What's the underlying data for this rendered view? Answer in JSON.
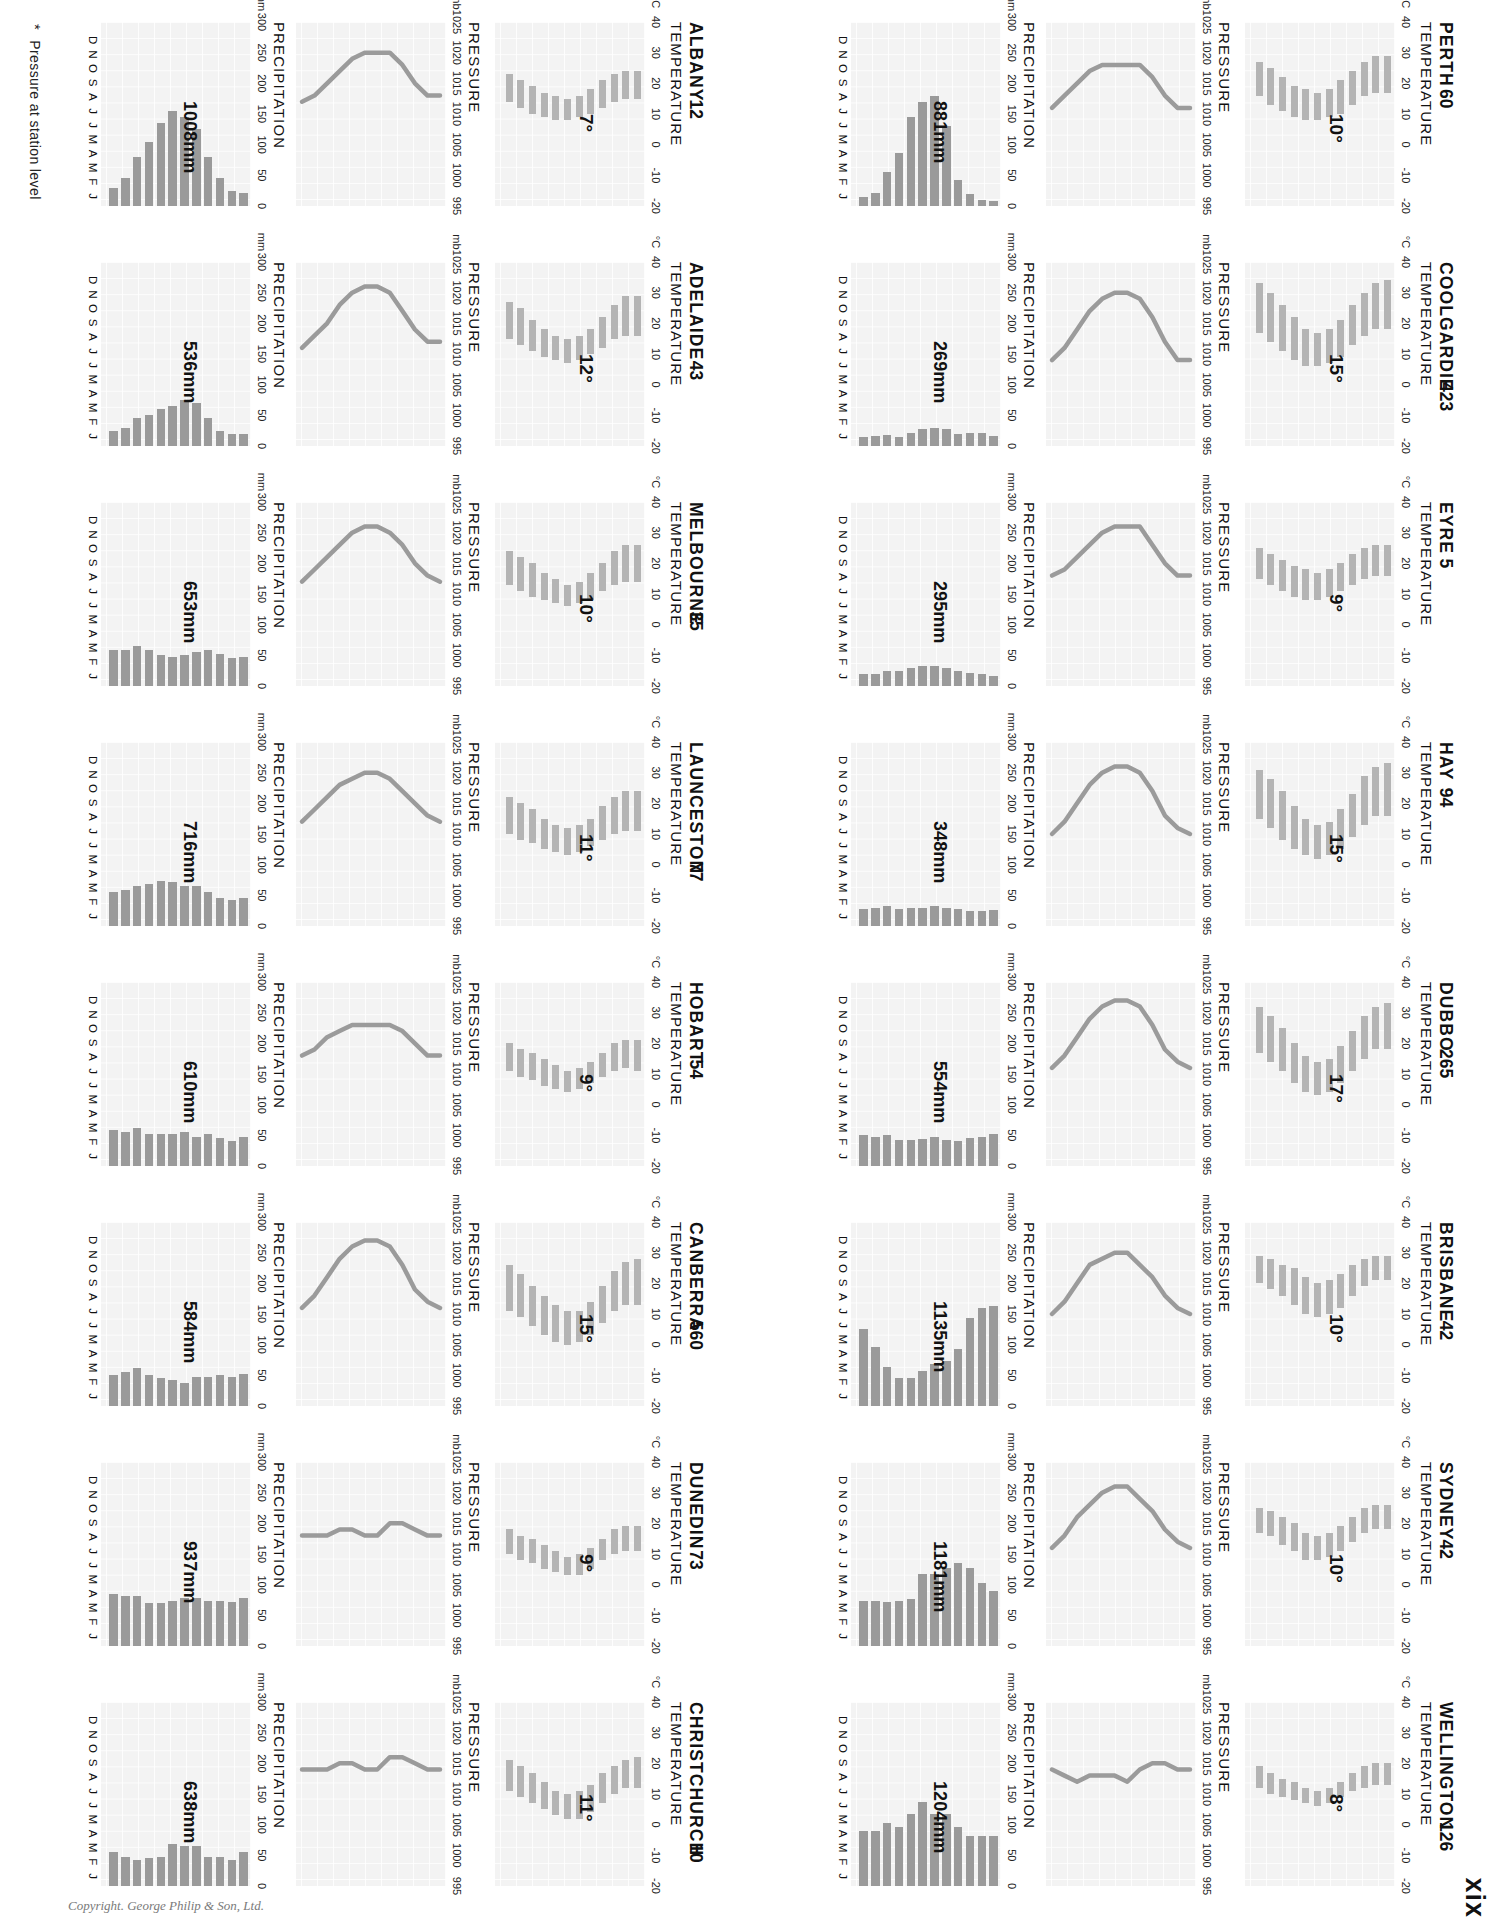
{
  "page": {
    "number": "xix",
    "copyright": "Copyright. George Philip & Son, Ltd.",
    "footnote": "Pressure at station level",
    "footnote_marker": "*"
  },
  "labels": {
    "temperature": "TEMPERATURE",
    "pressure": "PRESSURE",
    "precipitation": "PRECIPITATION",
    "temp_unit": "°C",
    "pressure_unit": "mb",
    "precip_unit": "mm"
  },
  "axes": {
    "temp_ticks": [
      "40",
      "30",
      "20",
      "10",
      "0",
      "-10",
      "-20"
    ],
    "temp_values": [
      40,
      30,
      20,
      10,
      0,
      -10,
      -20
    ],
    "pressure_ticks": [
      "1025",
      "1020",
      "1015",
      "1010",
      "1005",
      "1000",
      "995"
    ],
    "pressure_values": [
      1025,
      1020,
      1015,
      1010,
      1005,
      1000,
      995
    ],
    "precip_ticks": [
      "300",
      "250",
      "200",
      "150",
      "100",
      "50",
      "0"
    ],
    "precip_values": [
      300,
      250,
      200,
      150,
      100,
      50,
      0
    ],
    "months": [
      "J",
      "F",
      "M",
      "A",
      "M",
      "J",
      "J",
      "A",
      "S",
      "O",
      "N",
      "D"
    ]
  },
  "chart_data": {
    "type": "bar",
    "xlabel": "Month",
    "ylabels": [
      "Temperature °C",
      "Pressure mb",
      "Precipitation mm"
    ],
    "ylim_temp": [
      -20,
      40
    ],
    "ylim_pressure": [
      995,
      1025
    ],
    "ylim_precip": [
      0,
      300
    ],
    "grid": true,
    "legend": "none",
    "stations": [
      {
        "name": "PERTH",
        "altitude": "60",
        "temp_annotation": "10°",
        "precip_annotation": "881mm",
        "temp_min": [
          17,
          17,
          16,
          13,
          10,
          9,
          8,
          8,
          9,
          11,
          13,
          16
        ],
        "temp_max": [
          29,
          29,
          27,
          24,
          21,
          18,
          17,
          18,
          19,
          22,
          25,
          27
        ],
        "pressure": [
          1011,
          1011,
          1013,
          1016,
          1018,
          1018,
          1018,
          1018,
          1017,
          1015,
          1013,
          1011
        ],
        "precip": [
          8,
          10,
          20,
          43,
          130,
          180,
          170,
          145,
          86,
          56,
          21,
          14
        ]
      },
      {
        "name": "COOLGARDIE",
        "altitude": "423",
        "temp_annotation": "15°",
        "precip_annotation": "269mm",
        "temp_min": [
          18,
          18,
          16,
          13,
          9,
          7,
          6,
          6,
          8,
          11,
          14,
          17
        ],
        "temp_max": [
          34,
          33,
          30,
          26,
          21,
          18,
          17,
          18,
          22,
          26,
          30,
          33
        ],
        "pressure": [
          1009,
          1009,
          1012,
          1016,
          1019,
          1020,
          1020,
          1019,
          1017,
          1014,
          1011,
          1009
        ],
        "precip": [
          16,
          22,
          22,
          20,
          28,
          30,
          27,
          22,
          14,
          18,
          17,
          15
        ]
      },
      {
        "name": "EYRE",
        "altitude": "5",
        "temp_annotation": "9°",
        "precip_annotation": "295mm",
        "temp_min": [
          16,
          16,
          15,
          13,
          11,
          9,
          8,
          8,
          9,
          11,
          13,
          15
        ],
        "temp_max": [
          26,
          26,
          25,
          23,
          20,
          18,
          17,
          18,
          19,
          21,
          23,
          25
        ],
        "pressure": [
          1013,
          1013,
          1015,
          1018,
          1021,
          1021,
          1021,
          1020,
          1018,
          1016,
          1014,
          1013
        ],
        "precip": [
          16,
          20,
          22,
          25,
          30,
          33,
          32,
          30,
          24,
          24,
          20,
          19
        ]
      },
      {
        "name": "HAY",
        "altitude": "94",
        "temp_annotation": "15°",
        "precip_annotation": "348mm",
        "temp_min": [
          16,
          16,
          13,
          9,
          5,
          3,
          2,
          3,
          5,
          8,
          12,
          15
        ],
        "temp_max": [
          33,
          32,
          29,
          23,
          18,
          14,
          13,
          15,
          19,
          24,
          28,
          31
        ],
        "pressure": [
          1010,
          1011,
          1013,
          1017,
          1020,
          1021,
          1021,
          1020,
          1018,
          1015,
          1012,
          1010
        ],
        "precip": [
          26,
          25,
          25,
          27,
          30,
          32,
          30,
          30,
          28,
          33,
          30,
          28
        ]
      },
      {
        "name": "DUBBO",
        "altitude": "265",
        "temp_annotation": "17°",
        "precip_annotation": "554mm",
        "temp_min": [
          18,
          18,
          15,
          11,
          7,
          4,
          3,
          4,
          7,
          11,
          14,
          17
        ],
        "temp_max": [
          33,
          32,
          29,
          24,
          19,
          15,
          14,
          16,
          20,
          25,
          29,
          32
        ],
        "pressure": [
          1011,
          1012,
          1014,
          1018,
          1021,
          1022,
          1022,
          1021,
          1019,
          1016,
          1013,
          1011
        ],
        "precip": [
          52,
          48,
          45,
          40,
          42,
          48,
          44,
          42,
          42,
          50,
          48,
          50
        ]
      },
      {
        "name": "BRISBANE",
        "altitude": "42",
        "temp_annotation": "10°",
        "precip_annotation": "1135mm",
        "temp_min": [
          21,
          21,
          19,
          16,
          12,
          10,
          9,
          10,
          13,
          16,
          18,
          20
        ],
        "temp_max": [
          29,
          29,
          28,
          26,
          23,
          21,
          20,
          22,
          25,
          26,
          28,
          29
        ],
        "pressure": [
          1010,
          1011,
          1013,
          1016,
          1018,
          1020,
          1020,
          1019,
          1018,
          1015,
          1012,
          1010
        ],
        "precip": [
          163,
          160,
          143,
          93,
          73,
          68,
          57,
          46,
          46,
          64,
          97,
          125
        ]
      },
      {
        "name": "SYDNEY",
        "altitude": "42",
        "temp_annotation": "10°",
        "precip_annotation": "1181mm",
        "temp_min": [
          18,
          18,
          17,
          14,
          11,
          9,
          8,
          8,
          11,
          13,
          16,
          17
        ],
        "temp_max": [
          26,
          26,
          25,
          22,
          19,
          17,
          16,
          17,
          20,
          22,
          24,
          25
        ],
        "pressure": [
          1011,
          1012,
          1014,
          1017,
          1019,
          1021,
          1021,
          1020,
          1018,
          1016,
          1013,
          1011
        ],
        "precip": [
          89,
          102,
          127,
          135,
          127,
          117,
          117,
          76,
          74,
          71,
          74,
          74
        ]
      },
      {
        "name": "WELLINGTON",
        "altitude": "126",
        "temp_annotation": "8°",
        "precip_annotation": "1204mm",
        "temp_min": [
          13,
          13,
          12,
          11,
          9,
          7,
          6,
          7,
          8,
          9,
          10,
          12
        ],
        "temp_max": [
          20,
          20,
          19,
          17,
          14,
          12,
          11,
          12,
          14,
          15,
          17,
          19
        ],
        "pressure": [
          1014,
          1014,
          1015,
          1015,
          1014,
          1012,
          1013,
          1013,
          1013,
          1012,
          1013,
          1014
        ],
        "precip": [
          81,
          81,
          81,
          97,
          117,
          117,
          137,
          117,
          97,
          102,
          89,
          89
        ]
      },
      {
        "name": "ALBANY",
        "altitude": "12",
        "temp_annotation": "7°",
        "precip_annotation": "1008mm",
        "temp_min": [
          15,
          15,
          14,
          12,
          10,
          9,
          8,
          8,
          9,
          10,
          12,
          14
        ],
        "temp_max": [
          24,
          24,
          23,
          21,
          18,
          16,
          15,
          16,
          17,
          19,
          21,
          23
        ],
        "pressure": [
          1013,
          1013,
          1015,
          1018,
          1020,
          1020,
          1020,
          1019,
          1017,
          1015,
          1013,
          1012
        ],
        "precip": [
          22,
          25,
          45,
          80,
          125,
          145,
          155,
          135,
          105,
          80,
          45,
          30
        ]
      },
      {
        "name": "ADELAIDE",
        "altitude": "43",
        "temp_annotation": "12°",
        "precip_annotation": "536mm",
        "temp_min": [
          16,
          16,
          15,
          12,
          10,
          8,
          7,
          8,
          9,
          11,
          13,
          15
        ],
        "temp_max": [
          29,
          29,
          26,
          22,
          18,
          16,
          15,
          16,
          18,
          21,
          25,
          27
        ],
        "pressure": [
          1012,
          1012,
          1014,
          1017,
          1020,
          1021,
          1021,
          1020,
          1018,
          1015,
          1013,
          1011
        ],
        "precip": [
          20,
          20,
          25,
          45,
          70,
          75,
          65,
          60,
          50,
          45,
          30,
          25
        ]
      },
      {
        "name": "MELBOURNE",
        "altitude": "35",
        "temp_annotation": "10°",
        "precip_annotation": "653mm",
        "temp_min": [
          14,
          14,
          13,
          11,
          8,
          7,
          6,
          7,
          8,
          9,
          11,
          13
        ],
        "temp_max": [
          26,
          26,
          24,
          20,
          17,
          14,
          13,
          15,
          17,
          20,
          22,
          24
        ],
        "pressure": [
          1012,
          1013,
          1015,
          1018,
          1020,
          1021,
          1021,
          1020,
          1018,
          1016,
          1014,
          1012
        ],
        "precip": [
          48,
          46,
          53,
          58,
          56,
          50,
          48,
          50,
          58,
          66,
          58,
          58
        ]
      },
      {
        "name": "LAUNCESTON",
        "altitude": "77",
        "temp_annotation": "11°",
        "precip_annotation": "716mm",
        "temp_min": [
          11,
          11,
          10,
          8,
          6,
          4,
          3,
          4,
          5,
          7,
          8,
          10
        ],
        "temp_max": [
          24,
          24,
          22,
          19,
          15,
          13,
          12,
          13,
          15,
          18,
          20,
          22
        ],
        "pressure": [
          1012,
          1013,
          1015,
          1017,
          1019,
          1020,
          1020,
          1019,
          1018,
          1016,
          1014,
          1012
        ],
        "precip": [
          46,
          42,
          46,
          56,
          66,
          66,
          72,
          74,
          68,
          66,
          58,
          56
        ]
      },
      {
        "name": "HOBART",
        "altitude": "54",
        "temp_annotation": "9°",
        "precip_annotation": "610mm",
        "temp_min": [
          11,
          12,
          11,
          9,
          7,
          5,
          4,
          5,
          6,
          8,
          9,
          11
        ],
        "temp_max": [
          21,
          21,
          20,
          17,
          14,
          12,
          11,
          13,
          15,
          17,
          18,
          20
        ],
        "pressure": [
          1013,
          1013,
          1015,
          1017,
          1018,
          1018,
          1018,
          1018,
          1017,
          1016,
          1014,
          1013
        ],
        "precip": [
          48,
          40,
          46,
          52,
          48,
          56,
          53,
          53,
          53,
          62,
          56,
          58
        ]
      },
      {
        "name": "CANBERRA",
        "altitude": "560",
        "temp_annotation": "15°",
        "precip_annotation": "584mm",
        "temp_min": [
          13,
          13,
          11,
          7,
          3,
          1,
          0,
          1,
          3,
          6,
          9,
          11
        ],
        "temp_max": [
          28,
          27,
          24,
          19,
          14,
          11,
          11,
          13,
          16,
          19,
          23,
          26
        ],
        "pressure": [
          1011,
          1012,
          1014,
          1018,
          1021,
          1022,
          1022,
          1021,
          1019,
          1016,
          1013,
          1011
        ],
        "precip": [
          52,
          48,
          50,
          48,
          48,
          38,
          42,
          46,
          50,
          62,
          56,
          50
        ]
      },
      {
        "name": "DUNEDIN",
        "altitude": "73",
        "temp_annotation": "9°",
        "precip_annotation": "937mm",
        "temp_min": [
          11,
          11,
          10,
          8,
          5,
          3,
          3,
          4,
          5,
          7,
          8,
          10
        ],
        "temp_max": [
          19,
          19,
          18,
          15,
          12,
          10,
          9,
          11,
          13,
          15,
          16,
          18
        ],
        "pressure": [
          1013,
          1013,
          1014,
          1015,
          1015,
          1013,
          1013,
          1014,
          1014,
          1013,
          1013,
          1013
        ],
        "precip": [
          78,
          72,
          74,
          74,
          78,
          78,
          74,
          70,
          70,
          82,
          82,
          84
        ]
      },
      {
        "name": "CHRISTCHURCH",
        "altitude": "10",
        "temp_annotation": "11°",
        "precip_annotation": "638mm",
        "temp_min": [
          12,
          12,
          10,
          7,
          4,
          2,
          2,
          3,
          5,
          7,
          9,
          11
        ],
        "temp_max": [
          22,
          21,
          19,
          17,
          13,
          11,
          10,
          11,
          14,
          17,
          19,
          21
        ],
        "pressure": [
          1014,
          1014,
          1015,
          1016,
          1016,
          1014,
          1014,
          1015,
          1015,
          1014,
          1014,
          1014
        ],
        "precip": [
          56,
          43,
          48,
          48,
          66,
          66,
          69,
          48,
          46,
          43,
          48,
          56
        ]
      }
    ]
  }
}
